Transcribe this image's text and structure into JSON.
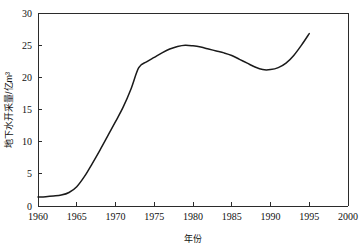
{
  "chart_data": {
    "type": "line",
    "title": "",
    "xlabel": "年份",
    "ylabel": "地下水开采量/亿m³",
    "xlim": [
      1960,
      2000
    ],
    "ylim": [
      0,
      30
    ],
    "xticks": [
      1960,
      1965,
      1970,
      1975,
      1980,
      1985,
      1990,
      1995,
      2000
    ],
    "xtick_labels": [
      "1960",
      "1965",
      "1970",
      "1975",
      "1980",
      "1985",
      "1990",
      "1995",
      "2000"
    ],
    "yticks": [
      0,
      5,
      10,
      15,
      20,
      25,
      30
    ],
    "ytick_labels": [
      "0",
      "5",
      "10",
      "15",
      "20",
      "25",
      "30"
    ],
    "grid": false,
    "legend": null,
    "series": [
      {
        "name": "地下水开采量",
        "x": [
          1960,
          1961,
          1962,
          1963,
          1964,
          1965,
          1966,
          1967,
          1968,
          1969,
          1970,
          1971,
          1972,
          1973,
          1974,
          1975,
          1976,
          1977,
          1978,
          1979,
          1980,
          1981,
          1982,
          1983,
          1984,
          1985,
          1986,
          1987,
          1988,
          1989,
          1990,
          1991,
          1992,
          1993,
          1994,
          1995
        ],
        "values": [
          1.4,
          1.45,
          1.55,
          1.7,
          2.1,
          3.0,
          4.6,
          6.6,
          8.7,
          10.9,
          13.1,
          15.4,
          18.2,
          21.5,
          22.4,
          23.1,
          23.8,
          24.4,
          24.8,
          25.0,
          24.9,
          24.7,
          24.4,
          24.1,
          23.8,
          23.4,
          22.8,
          22.2,
          21.6,
          21.2,
          21.2,
          21.5,
          22.2,
          23.4,
          25.0,
          26.8
        ]
      }
    ],
    "annotations": {
      "peak_year": 1979,
      "peak_value": 25.0,
      "trough_year": 1990,
      "trough_value": 21.2,
      "start_value": 1.4,
      "end_value": 26.8
    },
    "colors": {
      "curve": "#1a1a1a",
      "axis": "#2b2b2b",
      "background": "#ffffff",
      "text": "#111111"
    }
  }
}
